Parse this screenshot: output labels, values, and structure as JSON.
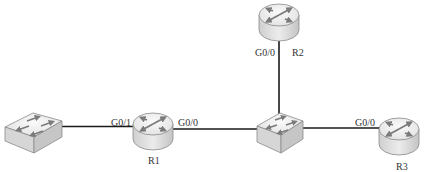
{
  "diagram": {
    "type": "network-topology",
    "colors": {
      "link": "#1a1a1a",
      "device_top": "#f2f2f2",
      "device_side": "#d9d9d9",
      "device_outline": "#8a8a8a",
      "arrow": "#777777",
      "label": "#333333"
    },
    "nodes": [
      {
        "id": "sw1",
        "kind": "switch",
        "icon": "switch-icon",
        "label": ""
      },
      {
        "id": "r1",
        "kind": "router",
        "icon": "router-icon",
        "label": "R1"
      },
      {
        "id": "sw2",
        "kind": "switch",
        "icon": "switch-icon",
        "label": ""
      },
      {
        "id": "r2",
        "kind": "router",
        "icon": "router-icon",
        "label": "R2"
      },
      {
        "id": "r3",
        "kind": "router",
        "icon": "router-icon",
        "label": "R3"
      }
    ],
    "links": [
      {
        "from": "sw1",
        "to": "r1",
        "to_port": "G0/1"
      },
      {
        "from": "r1",
        "to": "sw2",
        "from_port": "G0/0"
      },
      {
        "from": "r2",
        "to": "sw2",
        "from_port": "G0/0"
      },
      {
        "from": "sw2",
        "to": "r3",
        "to_port": "G0/0"
      }
    ],
    "labels": {
      "r1_g01": "G0/1",
      "r1_g00": "G0/0",
      "r1_name": "R1",
      "r2_g00": "G0/0",
      "r2_name": "R2",
      "r3_g00": "G0/0",
      "r3_name": "R3"
    }
  }
}
